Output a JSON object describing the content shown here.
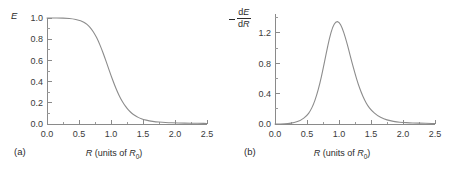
{
  "figure": {
    "panels": [
      {
        "id": "a",
        "panel_label": "(a)",
        "y_axis_label": "E",
        "x_axis_label_parts": {
          "var": "R",
          "text": " (units of ",
          "sub_var": "R",
          "sub": "0",
          "close": ")"
        },
        "x_ticks": [
          "0.0",
          "0.5",
          "1.0",
          "1.5",
          "2.0",
          "2.5"
        ],
        "y_ticks": [
          "0.0",
          "0.2",
          "0.4",
          "0.6",
          "0.8",
          "1.0"
        ]
      },
      {
        "id": "b",
        "panel_label": "(b)",
        "y_axis_label_minus": "−",
        "y_axis_num": "dE",
        "y_axis_den": "dR",
        "x_axis_label_parts": {
          "var": "R",
          "text": " (units of ",
          "sub_var": "R",
          "sub": "0",
          "close": ")"
        },
        "x_ticks": [
          "0.0",
          "0.5",
          "1.0",
          "1.5",
          "2.0",
          "2.5"
        ],
        "y_ticks": [
          "0.0",
          "0.4",
          "0.8",
          "1.2"
        ]
      }
    ]
  },
  "colors": {
    "curve": "#8c8c8c",
    "axis": "#8a8a8a",
    "text": "#2b2b2b",
    "background": "#ffffff"
  },
  "chart_data": [
    {
      "type": "line",
      "title": "",
      "panel": "(a)",
      "xlabel": "R (units of R0)",
      "ylabel": "E",
      "xlim": [
        0.0,
        2.5
      ],
      "ylim": [
        0.0,
        1.0
      ],
      "xticks": [
        0.0,
        0.5,
        1.0,
        1.5,
        2.0,
        2.5
      ],
      "yticks": [
        0.0,
        0.2,
        0.4,
        0.6,
        0.8,
        1.0
      ],
      "minor_tick_step_x": 0.25,
      "minor_tick_step_y": 0.1,
      "grid": false,
      "legend": "none",
      "x": [
        0.0,
        0.1,
        0.2,
        0.3,
        0.4,
        0.5,
        0.55,
        0.6,
        0.65,
        0.7,
        0.75,
        0.8,
        0.85,
        0.9,
        0.95,
        1.0,
        1.05,
        1.1,
        1.15,
        1.2,
        1.25,
        1.3,
        1.35,
        1.4,
        1.45,
        1.5,
        1.6,
        1.7,
        1.8,
        1.9,
        2.0,
        2.1,
        2.2,
        2.3,
        2.4,
        2.5
      ],
      "y": [
        1.0,
        1.0,
        0.999,
        0.998,
        0.993,
        0.98,
        0.969,
        0.952,
        0.927,
        0.892,
        0.845,
        0.785,
        0.713,
        0.631,
        0.545,
        0.458,
        0.376,
        0.303,
        0.24,
        0.189,
        0.147,
        0.114,
        0.089,
        0.07,
        0.055,
        0.044,
        0.029,
        0.021,
        0.016,
        0.013,
        0.011,
        0.009,
        0.008,
        0.007,
        0.006,
        0.005
      ],
      "series": [
        {
          "name": "E",
          "values": [
            1.0,
            1.0,
            0.999,
            0.998,
            0.993,
            0.98,
            0.969,
            0.952,
            0.927,
            0.892,
            0.845,
            0.785,
            0.713,
            0.631,
            0.545,
            0.458,
            0.376,
            0.303,
            0.24,
            0.189,
            0.147,
            0.114,
            0.089,
            0.07,
            0.055,
            0.044,
            0.029,
            0.021,
            0.016,
            0.013,
            0.011,
            0.009,
            0.008,
            0.007,
            0.006,
            0.005
          ]
        }
      ],
      "notes": "Monotonic sigmoid decay from 1.0 to ~0; half-height near R = 0.95"
    },
    {
      "type": "line",
      "title": "",
      "panel": "(b)",
      "xlabel": "R (units of R0)",
      "ylabel": "-dE/dR",
      "xlim": [
        0.0,
        2.5
      ],
      "ylim": [
        0.0,
        1.45
      ],
      "xticks": [
        0.0,
        0.5,
        1.0,
        1.5,
        2.0,
        2.5
      ],
      "yticks": [
        0.0,
        0.4,
        0.8,
        1.2
      ],
      "minor_tick_step_x": 0.25,
      "minor_tick_step_y": 0.2,
      "grid": false,
      "legend": "none",
      "peak_x": 1.0,
      "peak_y": 1.35,
      "x": [
        0.0,
        0.1,
        0.2,
        0.3,
        0.4,
        0.5,
        0.55,
        0.6,
        0.65,
        0.7,
        0.75,
        0.8,
        0.85,
        0.9,
        0.95,
        1.0,
        1.05,
        1.1,
        1.15,
        1.2,
        1.25,
        1.3,
        1.35,
        1.4,
        1.45,
        1.5,
        1.6,
        1.7,
        1.8,
        1.9,
        2.0,
        2.1,
        2.2,
        2.3,
        2.4,
        2.5
      ],
      "y": [
        0.0,
        0.002,
        0.006,
        0.018,
        0.046,
        0.11,
        0.17,
        0.255,
        0.375,
        0.53,
        0.72,
        0.93,
        1.13,
        1.28,
        1.35,
        1.348,
        1.27,
        1.14,
        0.985,
        0.82,
        0.665,
        0.525,
        0.41,
        0.315,
        0.24,
        0.185,
        0.11,
        0.066,
        0.042,
        0.028,
        0.02,
        0.015,
        0.012,
        0.01,
        0.008,
        0.007
      ],
      "series": [
        {
          "name": "-dE/dR",
          "values": [
            0.0,
            0.002,
            0.006,
            0.018,
            0.046,
            0.11,
            0.17,
            0.255,
            0.375,
            0.53,
            0.72,
            0.93,
            1.13,
            1.28,
            1.35,
            1.348,
            1.27,
            1.14,
            0.985,
            0.82,
            0.665,
            0.525,
            0.41,
            0.315,
            0.24,
            0.185,
            0.11,
            0.066,
            0.042,
            0.028,
            0.02,
            0.015,
            0.012,
            0.01,
            0.008,
            0.007
          ]
        }
      ],
      "notes": "Single asymmetric peak of height ~1.35 centred at R = 1.0, long right tail"
    }
  ]
}
